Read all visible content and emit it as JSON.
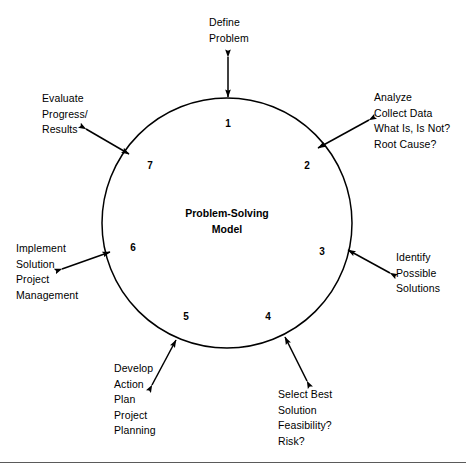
{
  "diagram": {
    "center_title_line1": "Problem-Solving",
    "center_title_line2": "Model",
    "circle": {
      "center_x": 227,
      "center_y": 223,
      "radius": 125,
      "stroke_color": "#000000",
      "fill_color": "#ffffff"
    },
    "background_color": "#ffffff",
    "line_color": "#000000",
    "steps": [
      {
        "number": "1",
        "label_lines": [
          "Define",
          "Problem"
        ],
        "arrow": "double-headed-arrow-step-1"
      },
      {
        "number": "2",
        "label_lines": [
          "Analyze",
          "Collect Data",
          "What Is, Is Not?",
          "Root Cause?"
        ],
        "arrow": "double-headed-arrow-step-2"
      },
      {
        "number": "3",
        "label_lines": [
          "Identify",
          "Possible",
          "Solutions"
        ],
        "arrow": "double-headed-arrow-step-3"
      },
      {
        "number": "4",
        "label_lines": [
          "Select Best",
          "Solution",
          "Feasibility?",
          "Risk?"
        ],
        "arrow": "double-headed-arrow-step-4"
      },
      {
        "number": "5",
        "label_lines": [
          "Develop",
          "Action",
          "Plan",
          "Project",
          "Planning"
        ],
        "arrow": "double-headed-arrow-step-5"
      },
      {
        "number": "6",
        "label_lines": [
          "Implement",
          "Solution",
          "Project",
          "Management"
        ],
        "arrow": "double-headed-arrow-step-6"
      },
      {
        "number": "7",
        "label_lines": [
          "Evaluate",
          "Progress/",
          "Results"
        ],
        "arrow": "double-headed-arrow-step-7"
      }
    ],
    "labels": {
      "step1_line1": "Define",
      "step1_line2": "Problem",
      "step2_line1": "Analyze",
      "step2_line2": "Collect Data",
      "step2_line3": "What Is, Is Not?",
      "step2_line4": "Root Cause?",
      "step3_line1": "Identify",
      "step3_line2": "Possible",
      "step3_line3": "Solutions",
      "step4_line1": "Select Best",
      "step4_line2": "Solution",
      "step4_line3": "Feasibility?",
      "step4_line4": "Risk?",
      "step5_line1": "Develop",
      "step5_line2": "Action",
      "step5_line3": "Plan",
      "step5_line4": "Project",
      "step5_line5": "Planning",
      "step6_line1": "Implement",
      "step6_line2": "Solution",
      "step6_line3": "Project",
      "step6_line4": "Management",
      "step7_line1": "Evaluate",
      "step7_line2": "Progress/",
      "step7_line3": "Results"
    },
    "numbers": {
      "n1": "1",
      "n2": "2",
      "n3": "3",
      "n4": "4",
      "n5": "5",
      "n6": "6",
      "n7": "7"
    },
    "footer_rule_color": "#5a5a5a"
  }
}
